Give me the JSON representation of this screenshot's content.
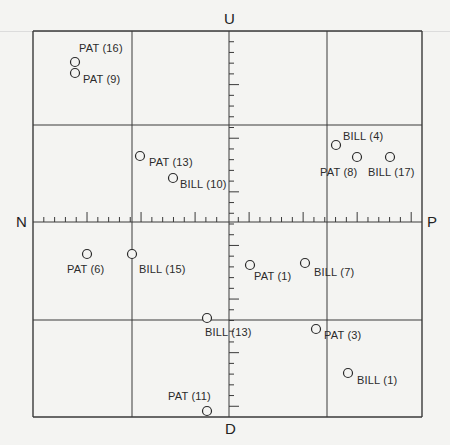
{
  "diagram": {
    "axes": {
      "top": "U",
      "bottom": "D",
      "left": "N",
      "right": "P"
    },
    "grid": {
      "x_lines": [
        33,
        132,
        229,
        327,
        422
      ],
      "y_lines": [
        31,
        125,
        222,
        320,
        417
      ],
      "center": [
        229,
        222
      ],
      "line_color": "#3a3a3a"
    },
    "points": [
      {
        "label": "PAT (16)",
        "x": 75,
        "y": 62,
        "lx": 79,
        "ly": 43
      },
      {
        "label": "PAT (9)",
        "x": 75,
        "y": 73,
        "lx": 83,
        "ly": 74
      },
      {
        "label": "PAT (13)",
        "x": 140,
        "y": 156,
        "lx": 149,
        "ly": 157
      },
      {
        "label": "BILL (10)",
        "x": 173,
        "y": 178,
        "lx": 180,
        "ly": 179
      },
      {
        "label": "BILL (4)",
        "x": 336,
        "y": 145,
        "lx": 343,
        "ly": 131
      },
      {
        "label": "PAT (8)",
        "x": 357,
        "y": 157,
        "lx": 320,
        "ly": 167
      },
      {
        "label": "BILL (17)",
        "x": 390,
        "y": 157,
        "lx": 368,
        "ly": 167
      },
      {
        "label": "PAT (6)",
        "x": 87,
        "y": 254,
        "lx": 67,
        "ly": 264
      },
      {
        "label": "BILL (15)",
        "x": 132,
        "y": 254,
        "lx": 139,
        "ly": 264
      },
      {
        "label": "PAT (1)",
        "x": 250,
        "y": 265,
        "lx": 254,
        "ly": 271
      },
      {
        "label": "BILL (7)",
        "x": 305,
        "y": 263,
        "lx": 314,
        "ly": 267
      },
      {
        "label": "BILL (13)",
        "x": 207,
        "y": 318,
        "lx": 205,
        "ly": 327
      },
      {
        "label": "PAT (3)",
        "x": 316,
        "y": 329,
        "lx": 324,
        "ly": 330
      },
      {
        "label": "BILL (1)",
        "x": 348,
        "y": 373,
        "lx": 357,
        "ly": 375
      },
      {
        "label": "PAT (11)",
        "x": 207,
        "y": 411,
        "lx": 168,
        "ly": 391
      }
    ]
  }
}
